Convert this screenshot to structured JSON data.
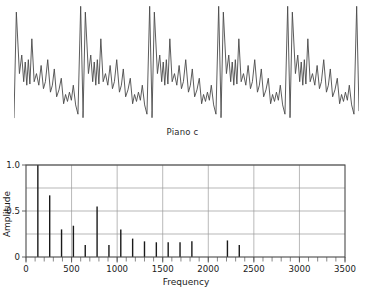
{
  "waveform": {
    "caption": "Piano c",
    "periods": 5,
    "description": "piano-note-time-waveform"
  },
  "chart_data": {
    "type": "bar",
    "title": "",
    "subtitle": "",
    "xlabel": "Frequency",
    "ylabel": "Amplitude",
    "xlim": [
      0,
      3500
    ],
    "ylim": [
      0,
      1.0
    ],
    "grid": true,
    "legend": "none",
    "x_major_ticks": [
      0,
      500,
      1000,
      1500,
      2000,
      2500,
      3000,
      3500
    ],
    "x_major_tick_labels": [
      "0",
      "500",
      "1000",
      "1500",
      "2000",
      "2500",
      "3000",
      "3500"
    ],
    "x_minor_tick_step": 100,
    "y_ticks": [
      0,
      0.5,
      1.0
    ],
    "y_tick_labels": [
      "0",
      "0.5",
      "1.0"
    ],
    "y_gridlines": [
      0.25,
      0.5,
      0.75,
      1.0
    ],
    "bar_color": "#1a1a1a",
    "grid_color": "#9a9a9a",
    "axis_color": "#555555",
    "x": [
      130,
      260,
      390,
      520,
      650,
      780,
      910,
      1040,
      1170,
      1300,
      1430,
      1560,
      1690,
      1820,
      2210,
      2340
    ],
    "values": [
      1.0,
      0.67,
      0.3,
      0.34,
      0.13,
      0.55,
      0.13,
      0.3,
      0.2,
      0.17,
      0.16,
      0.16,
      0.16,
      0.17,
      0.18,
      0.13
    ]
  },
  "waveform_points": {
    "period_shape": [
      [
        0.0,
        0.02
      ],
      [
        0.012,
        0.93
      ],
      [
        0.028,
        0.4
      ],
      [
        0.04,
        0.56
      ],
      [
        0.05,
        0.33
      ],
      [
        0.058,
        0.5
      ],
      [
        0.066,
        0.3
      ],
      [
        0.074,
        0.52
      ],
      [
        0.082,
        0.31
      ],
      [
        0.092,
        0.7
      ],
      [
        0.104,
        0.33
      ],
      [
        0.116,
        0.4
      ],
      [
        0.128,
        0.3
      ],
      [
        0.14,
        0.47
      ],
      [
        0.152,
        0.27
      ],
      [
        0.162,
        0.33
      ],
      [
        0.174,
        0.52
      ],
      [
        0.188,
        0.24
      ],
      [
        0.198,
        0.3
      ],
      [
        0.208,
        0.44
      ],
      [
        0.22,
        0.2
      ],
      [
        0.232,
        0.26
      ],
      [
        0.244,
        0.36
      ],
      [
        0.256,
        0.14
      ],
      [
        0.266,
        0.22
      ],
      [
        0.276,
        0.16
      ],
      [
        0.286,
        0.24
      ],
      [
        0.296,
        0.17
      ],
      [
        0.306,
        0.3
      ],
      [
        0.318,
        0.13
      ],
      [
        0.33,
        0.05
      ],
      [
        0.344,
        0.98
      ],
      [
        0.356,
        0.08
      ]
    ]
  }
}
